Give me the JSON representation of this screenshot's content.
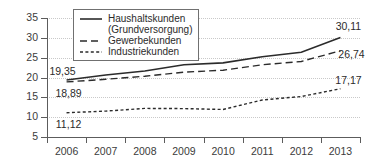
{
  "chart_data": {
    "type": "line",
    "title": "",
    "xlabel": "",
    "ylabel": "ct/kWh",
    "categories": [
      "2006",
      "2007",
      "2008",
      "2009",
      "2010",
      "2011",
      "2012",
      "2013"
    ],
    "x": [
      2006,
      2007,
      2008,
      2009,
      2010,
      2011,
      2012,
      2013
    ],
    "ylim": [
      5,
      35
    ],
    "yticks": [
      5,
      10,
      15,
      20,
      25,
      30,
      35
    ],
    "grid": "horizontal-dotted",
    "legend_position": "top-left-inside",
    "series": [
      {
        "name": "Haushaltskunden (Grundversorgung)",
        "style": "solid",
        "values": [
          19.35,
          20.64,
          21.65,
          23.21,
          23.69,
          25.23,
          26.36,
          30.11
        ],
        "start_label": "19,35",
        "end_label": "30,11"
      },
      {
        "name": "Gewerbekunden",
        "style": "dashed",
        "values": [
          18.89,
          19.55,
          20.32,
          21.35,
          21.84,
          23.21,
          24.05,
          26.74
        ],
        "start_label": "18,89",
        "end_label": "26,74"
      },
      {
        "name": "Industriekunden",
        "style": "dotted",
        "values": [
          11.12,
          11.53,
          12.21,
          12.16,
          11.94,
          14.33,
          15.21,
          17.17
        ],
        "start_label": "11,12",
        "end_label": "17,17"
      }
    ]
  },
  "axis": {
    "y_title": "ct/kWh",
    "y_tick_labels": [
      "35",
      "30",
      "25",
      "20",
      "15",
      "10",
      "5"
    ],
    "x_tick_labels": [
      "2006",
      "2007",
      "2008",
      "2009",
      "2010",
      "2011",
      "2012",
      "2013"
    ]
  },
  "legend": {
    "entries": [
      {
        "label": "Haushaltskunden",
        "label_line2": "(Grundversorgung)",
        "key": "solid-line-key"
      },
      {
        "label": "Gewerbekunden",
        "key": "dashed-line-key"
      },
      {
        "label": "Industriekunden",
        "key": "dotted-line-key"
      }
    ]
  },
  "labels": {
    "household_start": "19,35",
    "household_end": "30,11",
    "commercial_start": "18,89",
    "commercial_end": "26,74",
    "industry_start": "11,12",
    "industry_end": "17,17"
  },
  "colors": {
    "line": "#2b2b2b",
    "axis": "#5c5c5c",
    "grid": "#c9c9c9",
    "text": "#3b3b3b",
    "background": "#ffffff"
  }
}
